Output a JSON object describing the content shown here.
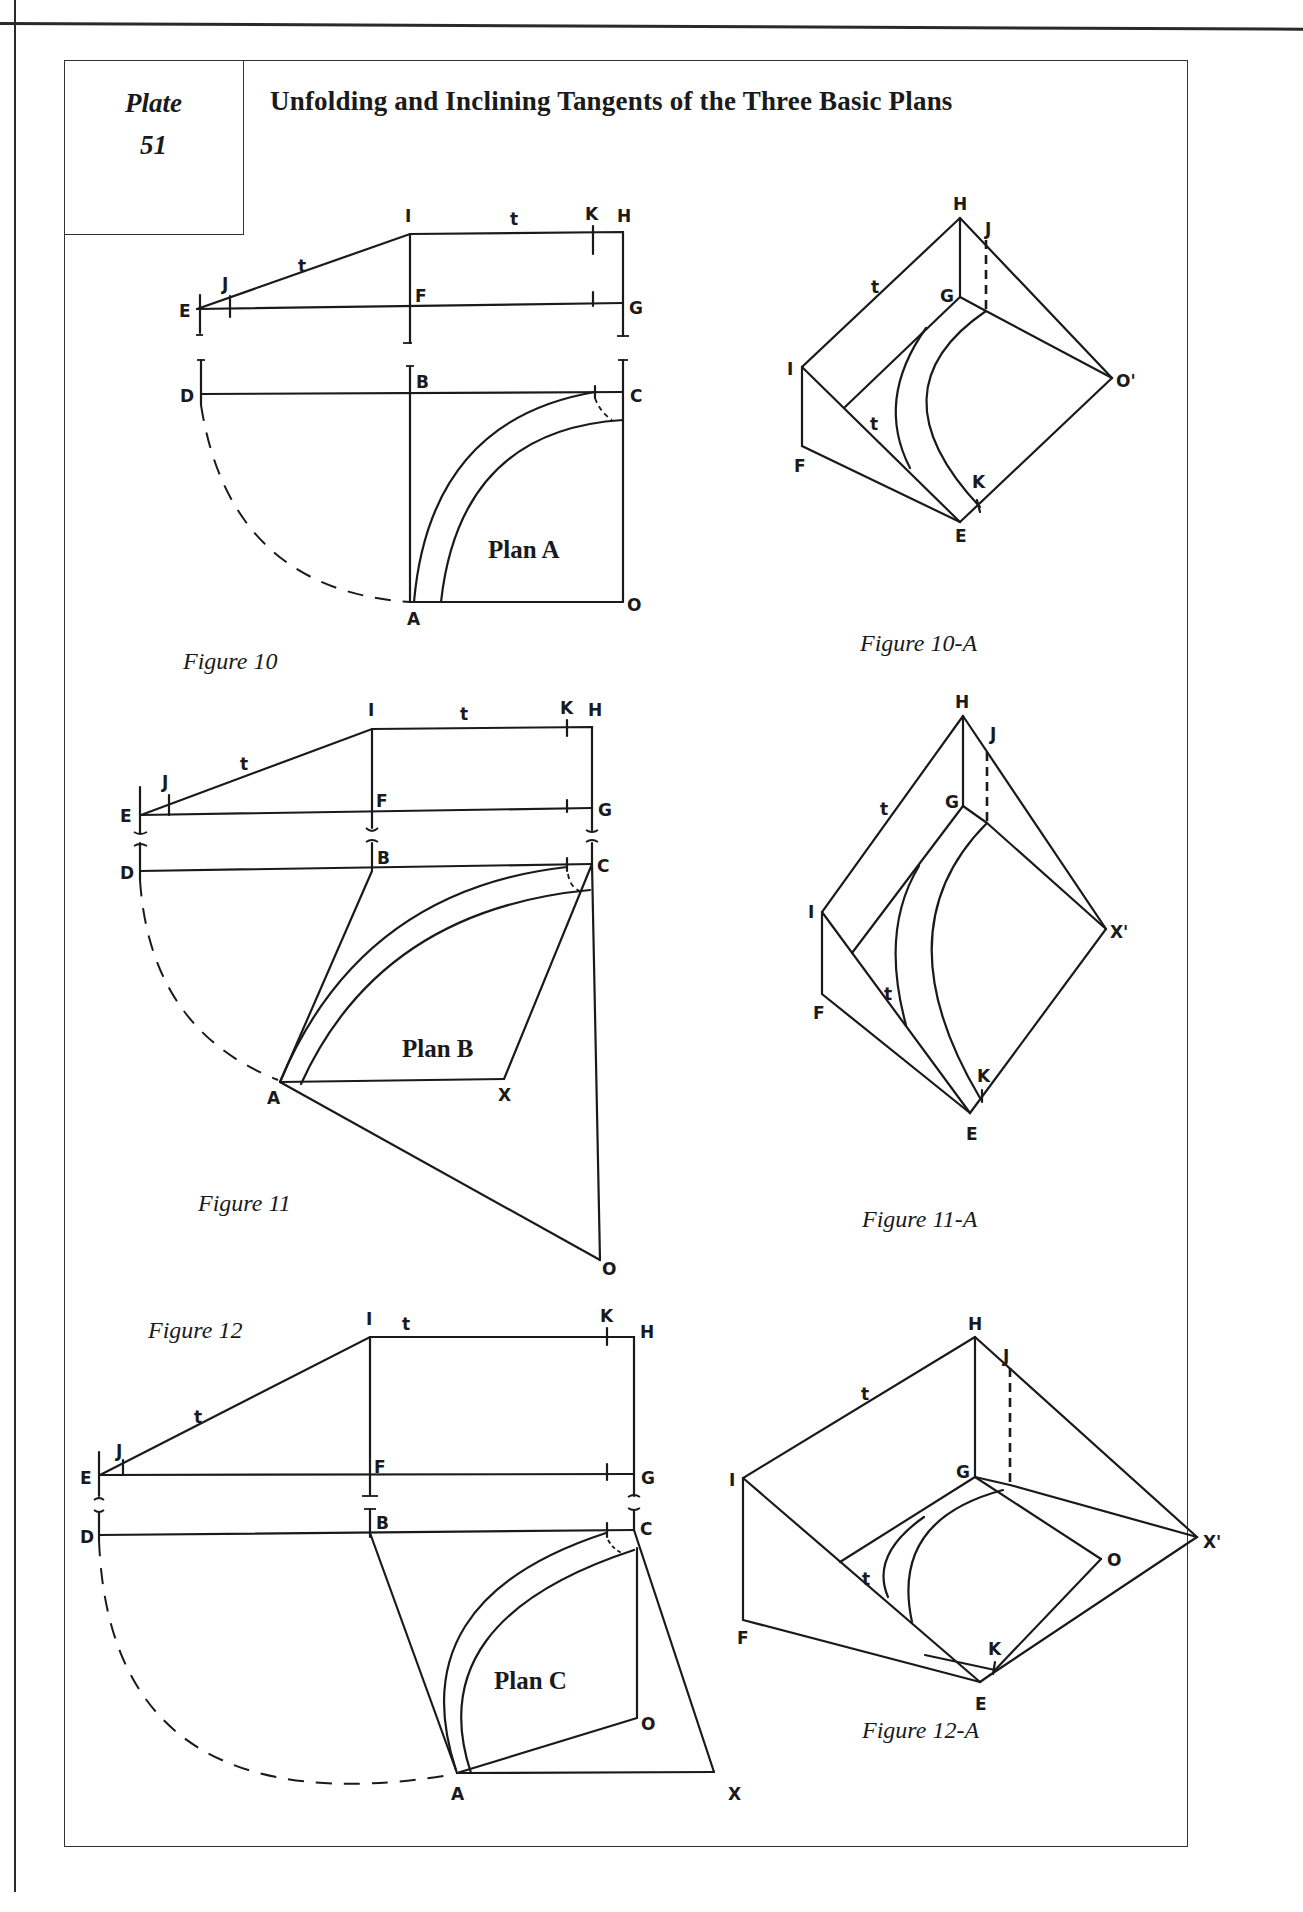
{
  "page": {
    "plate_word": "Plate",
    "plate_number": "51",
    "title": "Unfolding and Inclining Tangents of the Three Basic Plans"
  },
  "figures": [
    {
      "id": "fig10",
      "caption": "Figure 10",
      "plan_label": "Plan A",
      "points": [
        "E",
        "J",
        "I",
        "K",
        "H",
        "F",
        "G",
        "D",
        "B",
        "C",
        "A",
        "O"
      ],
      "tangent_label": "t"
    },
    {
      "id": "fig10a",
      "caption": "Figure 10-A",
      "points": [
        "H",
        "J",
        "G",
        "I",
        "O'",
        "F",
        "K",
        "E"
      ],
      "tangent_label": "t"
    },
    {
      "id": "fig11",
      "caption": "Figure 11",
      "plan_label": "Plan B",
      "points": [
        "E",
        "J",
        "I",
        "K",
        "H",
        "F",
        "G",
        "D",
        "B",
        "C",
        "A",
        "X",
        "O"
      ],
      "tangent_label": "t"
    },
    {
      "id": "fig11a",
      "caption": "Figure 11-A",
      "points": [
        "H",
        "J",
        "G",
        "I",
        "X'",
        "F",
        "K",
        "E"
      ],
      "tangent_label": "t"
    },
    {
      "id": "fig12",
      "caption": "Figure 12",
      "plan_label": "Plan C",
      "points": [
        "E",
        "J",
        "I",
        "K",
        "H",
        "F",
        "G",
        "D",
        "B",
        "C",
        "A",
        "O",
        "X"
      ],
      "tangent_label": "t"
    },
    {
      "id": "fig12a",
      "caption": "Figure 12-A",
      "points": [
        "H",
        "J",
        "G",
        "I",
        "X'",
        "O",
        "F",
        "K",
        "E"
      ],
      "tangent_label": "t"
    }
  ],
  "labels": {
    "E": "E",
    "J": "J",
    "I": "I",
    "K": "K",
    "H": "H",
    "F": "F",
    "G": "G",
    "D": "D",
    "B": "B",
    "C": "C",
    "A": "A",
    "O": "O",
    "X": "X",
    "O_prime": "O'",
    "X_prime": "X'",
    "t": "t"
  }
}
